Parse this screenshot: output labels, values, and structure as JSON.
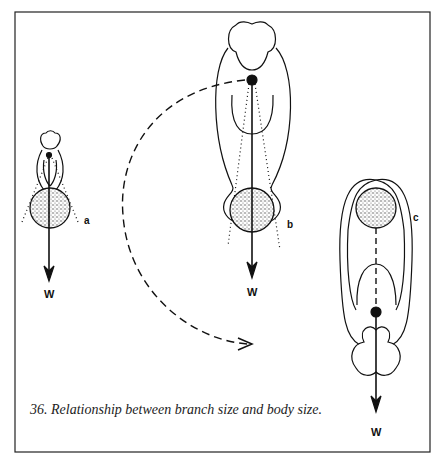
{
  "figure": {
    "caption": "36. Relationship between branch size and body size.",
    "panels": [
      {
        "id": "a",
        "label": "a",
        "weight_label": "W",
        "description": "small animal hanging below branch, short limbs"
      },
      {
        "id": "b",
        "label": "b",
        "weight_label": "W",
        "description": "large animal hanging below branch, center of mass above"
      },
      {
        "id": "c",
        "label": "c",
        "weight_label": "W",
        "description": "large animal rotated, body hanging below small branch"
      }
    ],
    "transition_arrow": "dashed arc from b to c"
  },
  "colors": {
    "ink": "#111111",
    "background": "#ffffff",
    "stipple": "#555555"
  }
}
